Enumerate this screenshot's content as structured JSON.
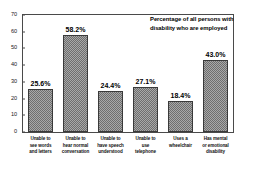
{
  "chart_data": {
    "type": "bar",
    "title_lines": [
      "Percentage of all persons with",
      "disability who are employed"
    ],
    "xlabel": "",
    "ylabel": "",
    "ylim": [
      0,
      70
    ],
    "grid": false,
    "legend": "none",
    "y_ticks": [
      "0",
      "10",
      "20",
      "30",
      "40",
      "50",
      "60",
      "70"
    ],
    "y_tick_values": [
      0,
      10,
      20,
      30,
      40,
      50,
      60,
      70
    ],
    "categories": [
      "Unable to see words and letters",
      "Unable to hear normal conversation",
      "Unable to have speech understood",
      "Unable to use telephone",
      "Uses a wheelchair",
      "Has mental or emotional disability"
    ],
    "category_lines": [
      [
        "Unable to",
        "see words",
        "and letters"
      ],
      [
        "Unable to",
        "hear normal",
        "conversation"
      ],
      [
        "Unable to",
        "have speech",
        "understood"
      ],
      [
        "Unable to",
        "use",
        "telephone"
      ],
      [
        "Uses a",
        "wheelchair"
      ],
      [
        "Has mental",
        "or emotional",
        "disability"
      ]
    ],
    "values": [
      25.6,
      58.2,
      24.4,
      27.1,
      18.4,
      43.0
    ],
    "value_labels": [
      "25.6%",
      "58.2%",
      "24.4%",
      "27.1%",
      "18.4%",
      "43.0%"
    ],
    "colors": {
      "bar_fill": "#a8a8a8",
      "bar_pattern": "#6e6e6e",
      "bar_outline": "#3a3a3a",
      "axis": "#4a4a4a",
      "text": "#000000",
      "background": "#ffffff"
    }
  }
}
